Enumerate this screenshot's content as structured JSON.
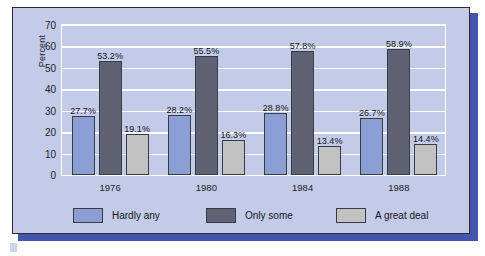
{
  "chart_data": {
    "type": "bar",
    "title": "",
    "subtitle": "",
    "xlabel": "",
    "ylabel": "Percent",
    "ylim": [
      0,
      70
    ],
    "yticks": [
      "0",
      "10",
      "20",
      "30",
      "40",
      "50",
      "60",
      "70"
    ],
    "grid": true,
    "legend_position": "bottom",
    "categories": [
      "1976",
      "1980",
      "1984",
      "1988"
    ],
    "series": [
      {
        "name": "Hardly any",
        "color": "#8c9ed6",
        "values": [
          27.7,
          28.2,
          28.8,
          26.7
        ],
        "labels": [
          "27.7%",
          "28.2%",
          "28.8%",
          "26.7%"
        ]
      },
      {
        "name": "Only some",
        "color": "#5e6272",
        "values": [
          53.2,
          55.5,
          57.8,
          58.9
        ],
        "labels": [
          "53.2%",
          "55.5%",
          "57.8%",
          "58.9%"
        ]
      },
      {
        "name": "A great deal",
        "color": "#c2c2c2",
        "values": [
          19.1,
          16.3,
          13.4,
          14.4
        ],
        "labels": [
          "19.1%",
          "16.3%",
          "13.4%",
          "14.4%"
        ]
      }
    ]
  },
  "figure": {
    "panel_background": "#c3cbe8",
    "panel_border": "#2b2b33",
    "shadow_color": "#4356ac",
    "gridline_color": "#ffffff",
    "plot_border_color": "#ffffff"
  }
}
